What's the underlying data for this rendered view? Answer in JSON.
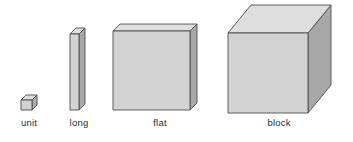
{
  "figure": {
    "background": "#ffffff",
    "outline_color": "#4a4a4a",
    "palette": {
      "top_face": "#dedede",
      "front_face": "#d2d2d2",
      "side_face": "#a8a8a8",
      "outline": "#4d4d4d",
      "label_text": "#2b2b2b"
    },
    "blocks": [
      {
        "id": "unit",
        "label": "unit",
        "label_x": 29,
        "label_y": 126,
        "front": "21,100 32,100 32,110 21,110",
        "top": "21,100 26,95 37,95 32,100",
        "side": "32,100 37,95 37,105 32,110"
      },
      {
        "id": "long",
        "label": "long",
        "label_x": 79,
        "label_y": 126,
        "front": "70,34 79,34 79,110 70,110",
        "top": "70,34 76,28 85,28 79,34",
        "side": "79,34 85,28 85,104 79,110"
      },
      {
        "id": "flat",
        "label": "flat",
        "label_x": 160,
        "label_y": 126,
        "front": "113,31 190,31 190,110 113,110",
        "top": "113,31 120,24 197,24 190,31",
        "side": "190,31 197,24 197,103 190,110"
      },
      {
        "id": "block",
        "label": "block",
        "label_x": 279,
        "label_y": 126,
        "front": "228,33 308,33 308,113 228,113",
        "top": "228,33 251,5 331,5 308,33",
        "side": "308,33 331,5 331,85 308,113"
      }
    ]
  }
}
